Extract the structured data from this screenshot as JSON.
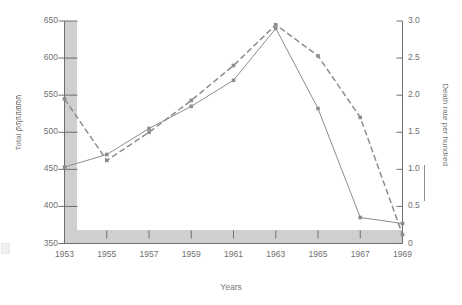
{
  "chart_data": {
    "type": "line",
    "title": "",
    "xlabel": "Years",
    "x": [
      1953,
      1955,
      1957,
      1959,
      1961,
      1963,
      1965,
      1967,
      1969
    ],
    "xtick_labels": [
      "1953",
      "1955",
      "1957",
      "1959",
      "1961",
      "1963",
      "1965",
      "1967",
      "1969"
    ],
    "xlim": [
      1953,
      1969
    ],
    "grid": false,
    "legend_position": "outside-left-and-right-axis-titles",
    "axes": [
      {
        "side": "left",
        "label": "Total population",
        "ylim": [
          350,
          650
        ],
        "tick_labels": [
          "350",
          "400",
          "450",
          "500",
          "550",
          "600",
          "650"
        ],
        "tick_values": [
          350,
          400,
          450,
          500,
          550,
          600,
          650
        ]
      },
      {
        "side": "right",
        "label": "Death rate per hundred",
        "ylim": [
          0,
          3.0
        ],
        "tick_labels": [
          "0",
          "0.5",
          "1.0",
          "1.5",
          "2.0",
          "2.5",
          "3.0"
        ],
        "tick_values": [
          0,
          0.5,
          1.0,
          1.5,
          2.0,
          2.5,
          3.0
        ]
      }
    ],
    "series": [
      {
        "name": "Total population",
        "axis": "left",
        "style": "dashed",
        "color": "#8d8d8d",
        "marker": "square",
        "values": [
          545,
          462,
          500,
          543,
          590,
          645,
          603,
          520,
          362
        ]
      },
      {
        "name": "Death rate per hundred",
        "axis": "right",
        "style": "solid",
        "color": "#8d8d8d",
        "marker": "square",
        "values": [
          1.03,
          1.2,
          1.55,
          1.85,
          2.2,
          2.9,
          1.82,
          0.35,
          0.27
        ]
      }
    ]
  },
  "labels": {
    "y_left_title": "Total population",
    "y_right_title": "Death rate per hundred",
    "x_title": "Years"
  }
}
